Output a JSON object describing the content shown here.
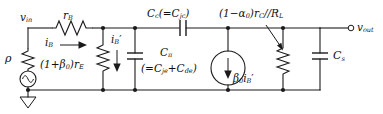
{
  "diagram": {
    "type": "schematic",
    "background_color": "#ffffff",
    "line_color": "#1a1a1a"
  },
  "labels": {
    "v_in": "v",
    "v_in_sub": "in",
    "source_resistance": "ρ",
    "base_resistance": "r",
    "base_resistance_sub": "B",
    "base_current": "i",
    "base_current_sub": "B",
    "base_current_prime": "i",
    "base_current_prime_sub": "B",
    "emitter_resistance_prefix": "(1+β",
    "emitter_resistance_prefix_sub": "0",
    "emitter_resistance_suffix": ")r",
    "emitter_resistance_suffix_sub": "E",
    "cc_main": "C",
    "cc_main_sub": "c",
    "cc_paren_open": "(=C",
    "cc_paren_sub": "jc",
    "cc_paren_close": ")",
    "cpi_main": "C",
    "cpi_main_sub": "π",
    "cpi_expr_open": "(=C",
    "cpi_expr_sub1": "je",
    "cpi_expr_plus": "+C",
    "cpi_expr_sub2": "de",
    "cpi_expr_close": ")",
    "load_prefix": "(1−α",
    "load_prefix_sub": "0",
    "load_mid": ")r",
    "load_mid_sub": "C",
    "load_slashes": "//R",
    "load_end_sub": "L",
    "dep_source": "β",
    "dep_source_sub": "0",
    "dep_source_cur": "i",
    "dep_source_cur_sub": "B",
    "cs_main": "C",
    "cs_main_sub": "s",
    "v_out": "v",
    "v_out_sub": "out"
  },
  "components": {
    "ground_symbol": "ground-triangle",
    "ac_source": "sinewave-source",
    "current_source": "dependent-current-source-down",
    "resistor_glyph": "zigzag",
    "capacitor_glyph": "parallel-plates"
  }
}
